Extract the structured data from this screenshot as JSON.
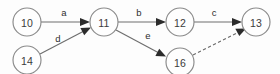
{
  "diagram": {
    "type": "directed-graph",
    "width": 280,
    "height": 74,
    "background_color": "#fdfdfd",
    "node_stroke_color": "#8a8a8a",
    "node_fill_color": "#fefefe",
    "node_label_color": "#3b3b3b",
    "edge_color": "#6e6e6e",
    "arrow_color": "#2b2b2b",
    "nodes": [
      {
        "id": "n10",
        "label": "10",
        "cx": 27,
        "cy": 22,
        "r": 14
      },
      {
        "id": "n14",
        "label": "14",
        "cx": 27,
        "cy": 60,
        "r": 14
      },
      {
        "id": "n11",
        "label": "11",
        "cx": 104,
        "cy": 22,
        "r": 14
      },
      {
        "id": "n12",
        "label": "12",
        "cx": 180,
        "cy": 22,
        "r": 14
      },
      {
        "id": "n13",
        "label": "13",
        "cx": 256,
        "cy": 22,
        "r": 14
      },
      {
        "id": "n16",
        "label": "16",
        "cx": 180,
        "cy": 62,
        "r": 14
      }
    ],
    "edges": [
      {
        "id": "e-a",
        "from": "n10",
        "to": "n11",
        "label": "a",
        "style": "solid",
        "label_x": 64,
        "label_y": 12
      },
      {
        "id": "e-b",
        "from": "n11",
        "to": "n12",
        "label": "b",
        "style": "solid",
        "label_x": 139,
        "label_y": 12
      },
      {
        "id": "e-c",
        "from": "n12",
        "to": "n13",
        "label": "c",
        "style": "solid",
        "label_x": 214,
        "label_y": 12
      },
      {
        "id": "e-d",
        "from": "n14",
        "to": "n11",
        "label": "d",
        "style": "solid",
        "label_x": 58,
        "label_y": 38
      },
      {
        "id": "e-e",
        "from": "n11",
        "to": "n16",
        "label": "e",
        "style": "solid",
        "label_x": 148,
        "label_y": 35
      },
      {
        "id": "e-f",
        "from": "n16",
        "to": "n13",
        "label": "",
        "style": "dashed",
        "label_x": 0,
        "label_y": 0
      }
    ]
  }
}
